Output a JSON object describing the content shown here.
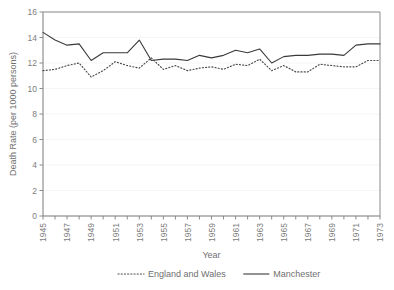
{
  "chart_data": {
    "type": "line",
    "title": "",
    "xlabel": "Year",
    "ylabel": "Death Rate (per 1000 persons)",
    "xlim": [
      1945,
      1973
    ],
    "ylim": [
      0,
      16
    ],
    "ytick_step": 2,
    "xtick_step": 1,
    "xtick_label_step": 2,
    "grid": false,
    "legend_position": "bottom-center",
    "yticks": [
      "0",
      "2",
      "4",
      "6",
      "8",
      "10",
      "12",
      "14",
      "16"
    ],
    "xticks": [
      "1945",
      "1946",
      "1947",
      "1948",
      "1949",
      "1950",
      "1951",
      "1952",
      "1953",
      "1954",
      "1955",
      "1956",
      "1957",
      "1958",
      "1959",
      "1960",
      "1961",
      "1962",
      "1963",
      "1964",
      "1965",
      "1966",
      "1967",
      "1968",
      "1969",
      "1970",
      "1971",
      "1972",
      "1973"
    ],
    "xtick_labels_shown": [
      "1945",
      "1947",
      "1949",
      "1951",
      "1953",
      "1955",
      "1957",
      "1959",
      "1961",
      "1963",
      "1965",
      "1967",
      "1969",
      "1971",
      "1973"
    ],
    "x": [
      1945,
      1946,
      1947,
      1948,
      1949,
      1950,
      1951,
      1952,
      1953,
      1954,
      1955,
      1956,
      1957,
      1958,
      1959,
      1960,
      1961,
      1962,
      1963,
      1964,
      1965,
      1966,
      1967,
      1968,
      1969,
      1970,
      1971,
      1972,
      1973
    ],
    "series": [
      {
        "name": "England and Wales",
        "style": "dotted",
        "color": "#4a4a4a",
        "values": [
          11.4,
          11.5,
          11.8,
          12.0,
          10.9,
          11.4,
          12.1,
          11.8,
          11.6,
          12.4,
          11.5,
          11.8,
          11.4,
          11.6,
          11.7,
          11.5,
          11.9,
          11.8,
          12.3,
          11.4,
          11.8,
          11.3,
          11.3,
          11.9,
          11.8,
          11.7,
          11.7,
          12.2,
          12.2
        ]
      },
      {
        "name": "Manchester",
        "style": "solid",
        "color": "#3a3a3a",
        "values": [
          14.4,
          13.8,
          13.4,
          13.5,
          12.2,
          12.8,
          12.8,
          12.8,
          13.8,
          12.2,
          12.3,
          12.3,
          12.2,
          12.6,
          12.4,
          12.6,
          13.0,
          12.8,
          13.1,
          12.0,
          12.5,
          12.6,
          12.6,
          12.7,
          12.7,
          12.6,
          13.4,
          13.5,
          13.5
        ]
      }
    ]
  },
  "legend": {
    "items": [
      {
        "label": "England and Wales",
        "style": "dotted"
      },
      {
        "label": "Manchester",
        "style": "solid"
      }
    ]
  },
  "axes": {
    "x_title": "Year",
    "y_title": "Death Rate (per 1000 persons)"
  }
}
